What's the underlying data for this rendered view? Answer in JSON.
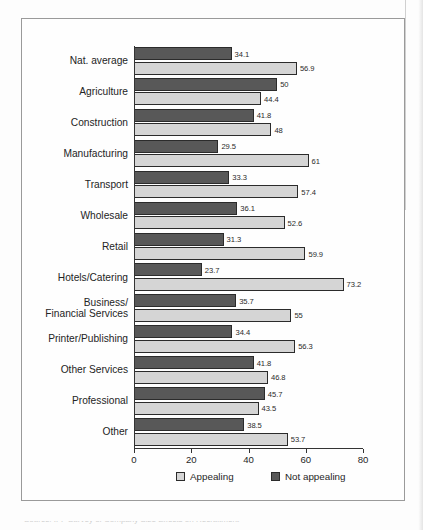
{
  "figure": {
    "frame": true,
    "caption_partial": "Source: IFF Survey of Company Size Effects on Recruitment"
  },
  "legend": {
    "items": [
      {
        "label": "Appealing",
        "color": "#d5d5d5",
        "key": "appealing"
      },
      {
        "label": "Not appealing",
        "color": "#585858",
        "key": "not_appealing"
      }
    ]
  },
  "axis": {
    "ticks": [
      0,
      20,
      40,
      60,
      80
    ],
    "tick_labels": [
      "0",
      "20",
      "40",
      "60",
      "80"
    ],
    "min": 0,
    "max": 80
  },
  "chart_data": {
    "type": "bar",
    "orientation": "horizontal",
    "title": "",
    "xlabel": "",
    "ylabel": "",
    "xlim": [
      0,
      80
    ],
    "grid": false,
    "legend_position": "bottom",
    "categories": [
      "Nat. average",
      "Agriculture",
      "Construction",
      "Manufacturing",
      "Transport",
      "Wholesale",
      "Retail",
      "Hotels/Catering",
      "Business/\nFinancial Services",
      "Printer/Publishing",
      "Other Services",
      "Professional",
      "Other"
    ],
    "series": [
      {
        "name": "Not appealing",
        "color": "#585858",
        "values": [
          34.1,
          50,
          41.8,
          29.5,
          33.3,
          36.1,
          31.3,
          23.7,
          35.7,
          34.4,
          41.8,
          45.7,
          38.5
        ],
        "value_labels": [
          "34.1",
          "50",
          "41.8",
          "29.5",
          "33.3",
          "36.1",
          "31.3",
          "23.7",
          "35.7",
          "34.4",
          "41.8",
          "45.7",
          "38.5"
        ]
      },
      {
        "name": "Appealing",
        "color": "#d5d5d5",
        "values": [
          56.9,
          44.4,
          48,
          61,
          57.4,
          52.6,
          59.9,
          73.2,
          55,
          56.3,
          46.8,
          43.5,
          53.7
        ],
        "value_labels": [
          "56.9",
          "44.4",
          "48",
          "61",
          "57.4",
          "52.6",
          "59.9",
          "73.2",
          "55",
          "56.3",
          "46.8",
          "43.5",
          "53.7"
        ]
      }
    ]
  }
}
